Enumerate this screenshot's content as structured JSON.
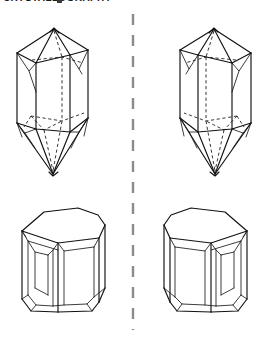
{
  "figure": {
    "caption_clipped": "CRYSTALLOGRAPHY",
    "caption_marker_label": "clipped-glyph-block",
    "background_color": "#ffffff",
    "line_color": "#111111",
    "hidden_line_color": "#222222",
    "divider_color": "#8c8c8c",
    "width_px": 266,
    "height_px": 342
  },
  "divider": {
    "name": "enantiomorph-divider",
    "orientation": "vertical",
    "style": "dashed",
    "x_px": 133,
    "y_start_px": 14,
    "y_end_px": 330
  },
  "panels": [
    {
      "id": "top-left",
      "label": "Left-handed dipyramidal quartz crystal",
      "habit": "hexagonal prism with terminating dipyramids and trigonal trapezohedral faces",
      "handedness": "left",
      "position": {
        "x_px": 15,
        "y_px": 28,
        "width_px": 76,
        "height_px": 148
      },
      "hidden_lines_visible": true
    },
    {
      "id": "top-right",
      "label": "Right-handed dipyramidal quartz crystal",
      "habit": "hexagonal prism with terminating dipyramids and trigonal trapezohedral faces",
      "handedness": "right",
      "position": {
        "x_px": 175,
        "y_px": 28,
        "width_px": 76,
        "height_px": 148
      },
      "hidden_lines_visible": true
    },
    {
      "id": "bottom-left",
      "label": "Left-handed stubby prismatic crystal",
      "habit": "short hexagonal prism with beveled rhombohedral terminations",
      "handedness": "left",
      "position": {
        "x_px": 18,
        "y_px": 205,
        "width_px": 88,
        "height_px": 110
      },
      "hidden_lines_visible": false
    },
    {
      "id": "bottom-right",
      "label": "Right-handed stubby prismatic crystal",
      "habit": "short hexagonal prism with beveled rhombohedral terminations",
      "handedness": "right",
      "position": {
        "x_px": 170,
        "y_px": 205,
        "width_px": 88,
        "height_px": 110
      },
      "hidden_lines_visible": false
    }
  ]
}
